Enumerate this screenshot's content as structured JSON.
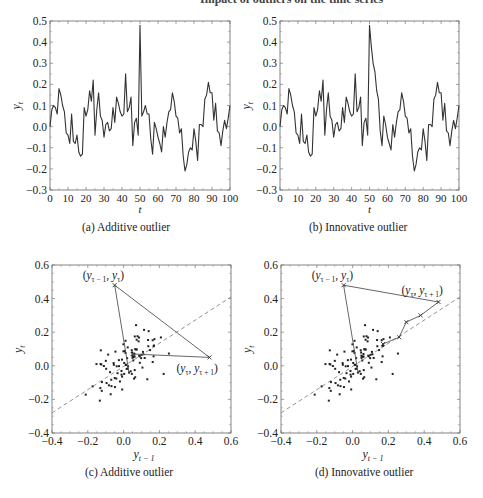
{
  "figure": {
    "title_partial": "... of outliers on the time series and the scatter plots of y_t against y_{t-1}",
    "panels": [
      {
        "id": "a",
        "caption": "(a) Additive outlier"
      },
      {
        "id": "b",
        "caption": "(b) Innovative outlier"
      },
      {
        "id": "c",
        "caption": "(c) Additive outlier"
      },
      {
        "id": "d",
        "caption": "(d) Innovative outlier"
      }
    ]
  },
  "chart_data": [
    {
      "panel": "a",
      "type": "line",
      "title": "(a) Additive outlier",
      "xlabel": "t",
      "ylabel": "y_t",
      "xlim": [
        0,
        100
      ],
      "ylim": [
        -0.3,
        0.5
      ],
      "xticks": [
        0,
        10,
        20,
        30,
        40,
        50,
        60,
        70,
        80,
        90,
        100
      ],
      "yticks": [
        -0.3,
        -0.2,
        -0.1,
        0.0,
        0.1,
        0.2,
        0.3,
        0.4,
        0.5
      ],
      "ytick_labels": [
        "−0.3",
        "−0.2",
        "−0.1",
        "0.0",
        "0.1",
        "0.2",
        "0.3",
        "0.4",
        "0.5"
      ],
      "grid": false,
      "series": [
        {
          "name": "y_t",
          "x_start": 0,
          "values": [
            0.0,
            0.08,
            0.1,
            0.09,
            0.06,
            0.18,
            0.15,
            0.1,
            0.07,
            -0.03,
            -0.04,
            -0.08,
            0.06,
            -0.07,
            -0.08,
            -0.04,
            -0.12,
            -0.14,
            -0.13,
            0.09,
            0.05,
            0.08,
            0.17,
            0.12,
            0.22,
            -0.04,
            0.08,
            0.16,
            0.05,
            0.03,
            -0.05,
            0.01,
            0.02,
            -0.02,
            -0.01,
            0.09,
            0.02,
            0.14,
            0.11,
            0.07,
            0.05,
            0.06,
            0.25,
            0.07,
            0.09,
            0.14,
            -0.09,
            0.02,
            0.04,
            -0.04,
            0.48,
            0.05,
            0.07,
            0.1,
            0.06,
            0.06,
            -0.06,
            -0.13,
            0.02,
            -0.01,
            -0.05,
            -0.08,
            -0.12,
            0.0,
            -0.05,
            0.02,
            0.07,
            0.08,
            0.16,
            0.12,
            0.05,
            0.04,
            -0.03,
            -0.01,
            -0.14,
            -0.21,
            -0.18,
            -0.12,
            -0.1,
            -0.11,
            -0.01,
            -0.07,
            -0.16,
            0.01,
            0.01,
            0.0,
            0.13,
            0.15,
            0.21,
            0.16,
            0.16,
            0.03,
            0.11,
            -0.02,
            -0.03,
            -0.09,
            -0.02,
            0.03,
            -0.01,
            0.04,
            0.1
          ]
        }
      ]
    },
    {
      "panel": "b",
      "type": "line",
      "title": "(b) Innovative outlier",
      "xlabel": "t",
      "ylabel": "y_t",
      "xlim": [
        0,
        100
      ],
      "ylim": [
        -0.3,
        0.5
      ],
      "xticks": [
        0,
        10,
        20,
        30,
        40,
        50,
        60,
        70,
        80,
        90,
        100
      ],
      "yticks": [
        -0.3,
        -0.2,
        -0.1,
        0.0,
        0.1,
        0.2,
        0.3,
        0.4,
        0.5
      ],
      "ytick_labels": [
        "−0.3",
        "−0.2",
        "−0.1",
        "0.0",
        "0.1",
        "0.2",
        "0.3",
        "0.4",
        "0.5"
      ],
      "grid": false,
      "series": [
        {
          "name": "y_t",
          "x_start": 0,
          "values": [
            0.0,
            0.08,
            0.1,
            0.09,
            0.06,
            0.18,
            0.15,
            0.1,
            0.07,
            -0.03,
            -0.04,
            -0.08,
            0.06,
            -0.07,
            -0.08,
            -0.04,
            -0.12,
            -0.14,
            -0.13,
            0.09,
            0.05,
            0.08,
            0.17,
            0.12,
            0.22,
            -0.04,
            0.08,
            0.16,
            0.05,
            0.03,
            -0.05,
            0.01,
            0.02,
            -0.02,
            -0.01,
            0.09,
            0.02,
            0.14,
            0.11,
            0.07,
            0.05,
            0.06,
            0.25,
            0.07,
            0.09,
            0.14,
            -0.09,
            0.02,
            0.04,
            -0.04,
            0.48,
            0.38,
            0.3,
            0.26,
            0.17,
            0.13,
            -0.02,
            -0.09,
            0.05,
            0.01,
            -0.05,
            -0.08,
            -0.11,
            0.01,
            -0.05,
            0.02,
            0.07,
            0.08,
            0.16,
            0.12,
            0.05,
            0.04,
            -0.03,
            -0.01,
            -0.14,
            -0.21,
            -0.18,
            -0.12,
            -0.1,
            -0.11,
            -0.01,
            -0.07,
            -0.16,
            0.01,
            0.01,
            0.0,
            0.13,
            0.15,
            0.21,
            0.16,
            0.16,
            0.03,
            0.11,
            -0.02,
            -0.03,
            -0.09,
            -0.02,
            0.03,
            -0.01,
            0.04,
            0.1
          ]
        }
      ]
    },
    {
      "panel": "c",
      "type": "scatter",
      "title": "(c) Additive outlier",
      "xlabel": "y_{t-1}",
      "ylabel": "y_t",
      "xlim": [
        -0.4,
        0.6
      ],
      "ylim": [
        -0.4,
        0.6
      ],
      "xticks": [
        -0.4,
        -0.2,
        0.0,
        0.2,
        0.4,
        0.6
      ],
      "yticks": [
        -0.4,
        -0.2,
        0.0,
        0.2,
        0.4,
        0.6
      ],
      "tick_labels": [
        "−0.4",
        "−0.2",
        "0.0",
        "0.2",
        "0.4",
        "0.6"
      ],
      "reference_line": {
        "style": "dashed",
        "from": [
          -0.4,
          -0.28
        ],
        "to": [
          0.6,
          0.41
        ]
      },
      "outlier_path": [
        [
          0.03,
          -0.04
        ],
        [
          -0.05,
          0.48
        ],
        [
          0.48,
          0.05
        ],
        [
          0.05,
          0.07
        ]
      ],
      "annotations": [
        {
          "text": "(y_{τ−1}, y_τ)",
          "at": [
            -0.05,
            0.48
          ]
        },
        {
          "text": "(y_τ, y_{τ+1})",
          "at": [
            0.48,
            0.05
          ]
        }
      ]
    },
    {
      "panel": "d",
      "type": "scatter",
      "title": "(d) Innovative outlier",
      "xlabel": "y_{t-1}",
      "ylabel": "y_t",
      "xlim": [
        -0.4,
        0.6
      ],
      "ylim": [
        -0.4,
        0.6
      ],
      "xticks": [
        -0.4,
        -0.2,
        0.0,
        0.2,
        0.4,
        0.6
      ],
      "yticks": [
        -0.4,
        -0.2,
        0.0,
        0.2,
        0.4,
        0.6
      ],
      "tick_labels": [
        "−0.4",
        "−0.2",
        "0.0",
        "0.2",
        "0.4",
        "0.6"
      ],
      "reference_line": {
        "style": "dashed",
        "from": [
          -0.4,
          -0.28
        ],
        "to": [
          0.6,
          0.41
        ]
      },
      "outlier_path": [
        [
          0.03,
          -0.04
        ],
        [
          -0.05,
          0.48
        ],
        [
          0.48,
          0.38
        ],
        [
          0.38,
          0.3
        ],
        [
          0.3,
          0.26
        ],
        [
          0.26,
          0.17
        ],
        [
          0.17,
          0.13
        ]
      ],
      "annotations": [
        {
          "text": "(y_{τ−1}, y_τ)",
          "at": [
            -0.05,
            0.48
          ]
        },
        {
          "text": "(y_τ, y_{τ+1})",
          "at": [
            0.48,
            0.38
          ]
        }
      ]
    }
  ]
}
